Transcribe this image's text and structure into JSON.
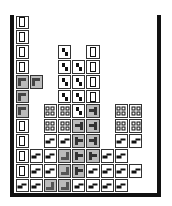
{
  "game": {
    "name": "Tetris playfield",
    "columns": 10,
    "rows": 12,
    "legend": {
      "I": "i-block",
      "S": "s-block",
      "Z": "z-block",
      "O": "o-block",
      "L": "l-block",
      "L2": "l-block-alt",
      "T": "t-block",
      "J": "j-block",
      ".": "empty"
    },
    "board": [
      [
        "I",
        ".",
        ".",
        ".",
        ".",
        ".",
        ".",
        ".",
        ".",
        "."
      ],
      [
        "I",
        ".",
        ".",
        ".",
        ".",
        ".",
        ".",
        ".",
        ".",
        "."
      ],
      [
        "I",
        ".",
        ".",
        "S",
        ".",
        "I",
        ".",
        ".",
        ".",
        "."
      ],
      [
        "I",
        ".",
        ".",
        "S",
        "S",
        "I",
        ".",
        ".",
        ".",
        "."
      ],
      [
        "L",
        "L",
        ".",
        "S",
        "S",
        "I",
        ".",
        ".",
        ".",
        "."
      ],
      [
        "L",
        ".",
        ".",
        "S",
        "S",
        "I",
        ".",
        ".",
        ".",
        "."
      ],
      [
        "L",
        ".",
        "O",
        "O",
        "S",
        "J",
        ".",
        "O",
        "O",
        "."
      ],
      [
        "I",
        ".",
        "O",
        "O",
        "J",
        "J",
        ".",
        "O",
        "O",
        "."
      ],
      [
        "I",
        ".",
        "Z",
        "Z",
        "T",
        "J",
        ".",
        "Z",
        "Z",
        "."
      ],
      [
        "I",
        "Z",
        "Z",
        "L2",
        "T",
        "T",
        "Z",
        "Z",
        ".",
        "."
      ],
      [
        "I",
        "Z",
        "Z",
        "L2",
        "T",
        "Z",
        "Z",
        "Z",
        "Z",
        "."
      ],
      [
        "Z",
        "Z",
        "L2",
        "L2",
        "Z",
        "Z",
        "Z",
        "Z",
        ".",
        "."
      ]
    ],
    "colors": {
      "wall": "#111111",
      "cell_border": "#333333",
      "gray_piece_fill": "#bbbbbb",
      "background": "#ffffff"
    }
  }
}
